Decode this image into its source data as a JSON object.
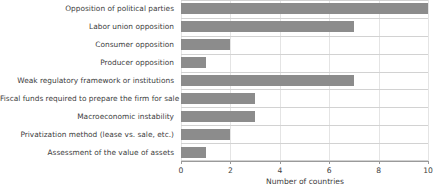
{
  "chart_data": {
    "type": "bar",
    "orientation": "horizontal",
    "title": "",
    "subtitle": "",
    "xlabel": "Number of countries",
    "ylabel": "",
    "xlim": [
      0,
      10
    ],
    "xticks": [
      0,
      2,
      4,
      6,
      8,
      10
    ],
    "xtick_labels": [
      "0",
      "2",
      "4",
      "6",
      "8",
      "10"
    ],
    "grid": true,
    "grid_axis": "both",
    "legend": false,
    "legend_position": "none",
    "bar_color": "#8c8c8c",
    "gridline_color": "#d2d2d2",
    "axis_color": "#9a9a9a",
    "categories": [
      "Opposition of political parties",
      "Labor union opposition",
      "Consumer opposition",
      "Producer opposition",
      "Weak regulatory framework or institutions",
      "Fiscal funds required to prepare the firm for sale",
      "Macroeconomic instability",
      "Privatization method (lease vs. sale, etc.)",
      "Assessment of the value of assets"
    ],
    "values": [
      10,
      7,
      2,
      1,
      7,
      3,
      3,
      2,
      1
    ]
  }
}
